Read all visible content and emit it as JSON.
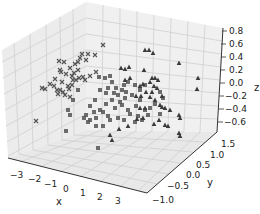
{
  "chart_data": {
    "type": "scatter",
    "projection": "3d",
    "title": "",
    "xlabel": "x",
    "ylabel": "y",
    "zlabel": "z",
    "xticks": [
      "−3",
      "−2",
      "−1",
      "0",
      "1",
      "2",
      "3"
    ],
    "yticks": [
      "−1.0",
      "−0.5",
      "0.0",
      "0.5",
      "1.0",
      "1.5"
    ],
    "zticks": [
      "0.8",
      "0.6",
      "0.4",
      "0.2",
      "0.0",
      "−0.2",
      "−0.4",
      "−0.6"
    ],
    "xlim": [
      -3.5,
      3.5
    ],
    "ylim": [
      -1.2,
      1.6
    ],
    "zlim": [
      -0.7,
      0.85
    ],
    "grid": true,
    "legend": null,
    "marker_color": "#555555",
    "series": [
      {
        "name": "class-x",
        "marker": "x",
        "count_approx": 40,
        "points_screen": [
          [
            42,
            88
          ],
          [
            45,
            89
          ],
          [
            55,
            79
          ],
          [
            60,
            70
          ],
          [
            62,
            82
          ],
          [
            58,
            94
          ],
          [
            65,
            95
          ],
          [
            68,
            86
          ],
          [
            72,
            76
          ],
          [
            74,
            73
          ],
          [
            70,
            68
          ],
          [
            75,
            64
          ],
          [
            78,
            62
          ],
          [
            80,
            58
          ],
          [
            86,
            60
          ],
          [
            88,
            54
          ],
          [
            82,
            54
          ],
          [
            95,
            55
          ],
          [
            73,
            80
          ],
          [
            76,
            80
          ],
          [
            79,
            78
          ],
          [
            63,
            92
          ],
          [
            57,
            90
          ],
          [
            60,
            90
          ],
          [
            72,
            85
          ],
          [
            83,
            77
          ],
          [
            70,
            97
          ],
          [
            36,
            121
          ],
          [
            103,
            45
          ],
          [
            96,
            72
          ],
          [
            90,
            76
          ],
          [
            66,
            74
          ],
          [
            61,
            72
          ],
          [
            64,
            62
          ],
          [
            59,
            61
          ],
          [
            69,
            89
          ],
          [
            54,
            86
          ],
          [
            50,
            84
          ],
          [
            85,
            80
          ],
          [
            78,
            70
          ]
        ]
      },
      {
        "name": "class-square",
        "marker": "s",
        "count_approx": 60,
        "points_screen": [
          [
            99,
            77
          ],
          [
            105,
            78
          ],
          [
            110,
            76
          ],
          [
            112,
            82
          ],
          [
            108,
            88
          ],
          [
            116,
            88
          ],
          [
            118,
            95
          ],
          [
            122,
            90
          ],
          [
            124,
            85
          ],
          [
            128,
            82
          ],
          [
            135,
            85
          ],
          [
            140,
            90
          ],
          [
            132,
            95
          ],
          [
            125,
            98
          ],
          [
            120,
            102
          ],
          [
            112,
            100
          ],
          [
            106,
            104
          ],
          [
            100,
            110
          ],
          [
            94,
            112
          ],
          [
            90,
            106
          ],
          [
            86,
            115
          ],
          [
            84,
            118
          ],
          [
            90,
            120
          ],
          [
            96,
            118
          ],
          [
            103,
            112
          ],
          [
            108,
            116
          ],
          [
            115,
            108
          ],
          [
            122,
            105
          ],
          [
            128,
            110
          ],
          [
            130,
            114
          ],
          [
            124,
            120
          ],
          [
            118,
            118
          ],
          [
            110,
            120
          ],
          [
            103,
            126
          ],
          [
            96,
            126
          ],
          [
            88,
            122
          ],
          [
            68,
            110
          ],
          [
            70,
            115
          ],
          [
            66,
            131
          ],
          [
            98,
            148
          ],
          [
            140,
            100
          ],
          [
            136,
            106
          ],
          [
            145,
            110
          ],
          [
            150,
            108
          ],
          [
            155,
            104
          ],
          [
            148,
            115
          ],
          [
            142,
            120
          ],
          [
            138,
            116
          ],
          [
            135,
            122
          ],
          [
            160,
            92
          ],
          [
            163,
            98
          ],
          [
            160,
            114
          ],
          [
            145,
            85
          ],
          [
            78,
            90
          ],
          [
            73,
            100
          ],
          [
            100,
            90
          ],
          [
            106,
            93
          ],
          [
            114,
            93
          ],
          [
            126,
            92
          ],
          [
            95,
            100
          ]
        ]
      },
      {
        "name": "class-triangle",
        "marker": "^",
        "count_approx": 45,
        "points_screen": [
          [
            145,
            50
          ],
          [
            149,
            50
          ],
          [
            153,
            53
          ],
          [
            121,
            68
          ],
          [
            125,
            69
          ],
          [
            129,
            67
          ],
          [
            144,
            70
          ],
          [
            179,
            63
          ],
          [
            198,
            78
          ],
          [
            197,
            89
          ],
          [
            125,
            80
          ],
          [
            130,
            78
          ],
          [
            152,
            78
          ],
          [
            155,
            78
          ],
          [
            158,
            80
          ],
          [
            150,
            82
          ],
          [
            143,
            84
          ],
          [
            140,
            86
          ],
          [
            154,
            86
          ],
          [
            157,
            88
          ],
          [
            146,
            92
          ],
          [
            152,
            92
          ],
          [
            141,
            96
          ],
          [
            162,
            96
          ],
          [
            150,
            97
          ],
          [
            155,
            100
          ],
          [
            136,
            96
          ],
          [
            140,
            108
          ],
          [
            145,
            108
          ],
          [
            110,
            135
          ],
          [
            112,
            140
          ],
          [
            119,
            129
          ],
          [
            128,
            126
          ],
          [
            137,
            119
          ],
          [
            143,
            118
          ],
          [
            159,
            120
          ],
          [
            160,
            105
          ],
          [
            162,
            107
          ],
          [
            165,
            108
          ],
          [
            170,
            110
          ],
          [
            165,
            125
          ],
          [
            168,
            126
          ],
          [
            179,
            115
          ],
          [
            180,
            118
          ],
          [
            180,
            136
          ],
          [
            179,
            133
          ],
          [
            154,
            124
          ]
        ]
      }
    ]
  }
}
